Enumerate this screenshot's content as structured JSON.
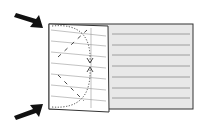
{
  "diagram": {
    "type": "folding-instruction",
    "colors": {
      "background": "#ffffff",
      "sheet_fill": "#e8e8e8",
      "flap_fill": "#ffffff",
      "outline": "#333333",
      "ruled_lines": "#888888",
      "arrows": "#111111"
    },
    "arrows": [
      {
        "id": "top-left-arrow",
        "points_to": "top-left corner of flap"
      },
      {
        "id": "bottom-left-arrow",
        "points_to": "bottom-left corner of flap"
      }
    ],
    "ruled_lines_count": 7
  }
}
